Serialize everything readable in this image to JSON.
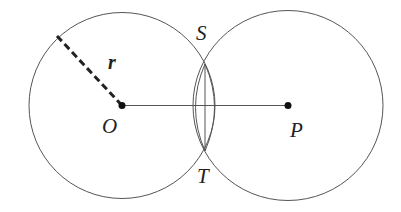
{
  "diagram": {
    "type": "geometry-two-intersecting-circles",
    "colors": {
      "stroke": "#555555",
      "point": "#111111",
      "radius_dash": "#222222",
      "background": "#ffffff"
    },
    "circles": [
      {
        "id": "circle-O",
        "cx": 122,
        "cy": 105.5,
        "r": 93
      },
      {
        "id": "circle-P",
        "cx": 288,
        "cy": 105.5,
        "r": 95
      }
    ],
    "points": [
      {
        "id": "O",
        "x": 122,
        "y": 105.5
      },
      {
        "id": "P",
        "x": 288,
        "y": 105.5
      }
    ],
    "intersections": [
      {
        "id": "S",
        "x": 205,
        "y": 64
      },
      {
        "id": "T",
        "x": 205,
        "y": 151
      }
    ],
    "labels": {
      "O": "O",
      "P": "P",
      "S": "S",
      "T": "T",
      "r": "r"
    },
    "segments": {
      "OP": {
        "x1": 122,
        "y1": 105.5,
        "x2": 288,
        "y2": 105.5
      },
      "ST": {
        "x1": 205,
        "y1": 64,
        "x2": 205,
        "y2": 151
      },
      "radius_r": {
        "x1": 57,
        "y1": 36,
        "x2": 122,
        "y2": 105.5,
        "dashed": true
      }
    }
  }
}
